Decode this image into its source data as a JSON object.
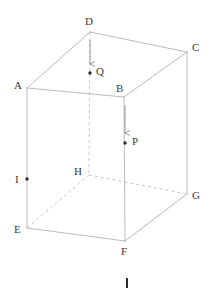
{
  "figure": {
    "type": "geometry-diagram",
    "shape": "rectangular-prism",
    "background_color": "#ffffff",
    "edge_color": "#a8a8a8",
    "hidden_edge_color": "#b9b9b9",
    "arrow_color": "#8e8e8e",
    "point_color": "#2b2b2b",
    "label_color": "#3a3a3a",
    "vertices": [
      {
        "id": "A",
        "label": "A",
        "x": 27,
        "y": 88,
        "label_x": 14,
        "label_y": 80,
        "kind": "visible"
      },
      {
        "id": "B",
        "label": "B",
        "x": 124,
        "y": 97,
        "label_x": 116,
        "label_y": 83,
        "kind": "visible"
      },
      {
        "id": "C",
        "label": "C",
        "x": 187,
        "y": 52,
        "label_x": 192,
        "label_y": 42,
        "kind": "visible"
      },
      {
        "id": "D",
        "label": "D",
        "x": 90,
        "y": 32,
        "label_x": 85,
        "label_y": 16,
        "kind": "visible"
      },
      {
        "id": "E",
        "label": "E",
        "x": 27,
        "y": 228,
        "label_x": 14,
        "label_y": 224,
        "kind": "visible"
      },
      {
        "id": "F",
        "label": "F",
        "x": 125,
        "y": 241,
        "label_x": 121,
        "label_y": 246,
        "kind": "visible"
      },
      {
        "id": "G",
        "label": "G",
        "x": 187,
        "y": 194,
        "label_x": 192,
        "label_y": 190,
        "kind": "visible"
      },
      {
        "id": "H",
        "label": "H",
        "x": 89,
        "y": 175,
        "label_x": 74,
        "label_y": 166,
        "kind": "hidden"
      }
    ],
    "marked_points": [
      {
        "id": "P",
        "label": "P",
        "x": 125,
        "y": 143,
        "label_x": 132,
        "label_y": 136,
        "on_edge": "B-F"
      },
      {
        "id": "Q",
        "label": "Q",
        "x": 90,
        "y": 73,
        "label_x": 96,
        "label_y": 66,
        "on_edge": "D-H"
      },
      {
        "id": "I",
        "label": "I",
        "x": 27,
        "y": 179,
        "label_x": 15,
        "label_y": 174,
        "on_edge": "A-E"
      }
    ],
    "solid_edges": [
      {
        "from": "A",
        "to": "D"
      },
      {
        "from": "D",
        "to": "C"
      },
      {
        "from": "A",
        "to": "B"
      },
      {
        "from": "B",
        "to": "C"
      },
      {
        "from": "A",
        "to": "E"
      },
      {
        "from": "B",
        "to": "F"
      },
      {
        "from": "C",
        "to": "G"
      },
      {
        "from": "E",
        "to": "F"
      },
      {
        "from": "F",
        "to": "G"
      }
    ],
    "dashed_edges": [
      {
        "from": "D",
        "to": "H"
      },
      {
        "from": "H",
        "to": "E"
      },
      {
        "from": "H",
        "to": "G"
      }
    ],
    "arrows": [
      {
        "id": "arrow-D-to-Q",
        "x": 90,
        "y1": 40,
        "y2": 64,
        "direction": "down"
      },
      {
        "id": "arrow-B-to-P",
        "x": 125,
        "y1": 105,
        "y2": 133,
        "direction": "down"
      }
    ],
    "bottom_tick": {
      "id": "bottom-tick-mark",
      "x": 127,
      "y": 278,
      "width": 2,
      "height": 10
    }
  }
}
